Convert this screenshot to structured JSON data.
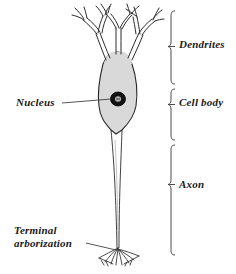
{
  "figure": {
    "type": "labeled-biological-diagram",
    "background_color": "#ffffff",
    "ink_color": "#2b2b2b",
    "soma_fill_color": "#d9d9d9",
    "nucleus_color": "#111111",
    "width": 236,
    "height": 274
  },
  "bracket_labels": [
    {
      "id": "dendrites",
      "text": "Dendrites",
      "bracket_top": 10,
      "bracket_bottom": 84
    },
    {
      "id": "cell-body",
      "text": "Cell body",
      "bracket_top": 88,
      "bracket_bottom": 140
    },
    {
      "id": "axon",
      "text": "Axon",
      "bracket_top": 144,
      "bracket_bottom": 254
    }
  ],
  "leader_labels": [
    {
      "id": "nucleus",
      "text": "Nucleus"
    },
    {
      "id": "terminal",
      "line1": "Terminal",
      "line2": "arborization"
    }
  ]
}
